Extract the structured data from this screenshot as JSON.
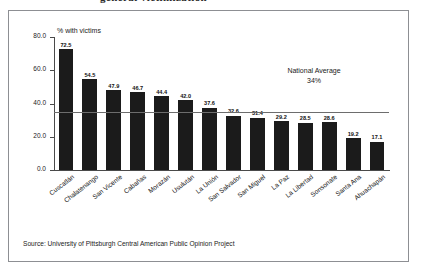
{
  "page": {
    "title_fragment": "general victimization",
    "source_note": "Source:  University of Pittsburgh Central American Public Opinion Project"
  },
  "chart_data": {
    "type": "bar",
    "title": "",
    "xlabel": "",
    "ylabel": "% with victims",
    "ylim": [
      0,
      80
    ],
    "yticks": [
      "0.0",
      "20.0",
      "40.0",
      "60.0",
      "80.0"
    ],
    "grid": false,
    "legend": "none",
    "categories": [
      "Cuscatlán",
      "Chalatenango",
      "San Vicente",
      "Cabañas",
      "Morazán",
      "Usulután",
      "La Unión",
      "San Salvador",
      "San Miguel",
      "La Paz",
      "La Libertad",
      "Sonsonate",
      "Santa Ana",
      "Ahuachapán"
    ],
    "values": [
      72.5,
      54.5,
      47.9,
      46.7,
      44.4,
      42.0,
      37.6,
      32.6,
      31.4,
      29.2,
      28.5,
      28.6,
      19.2,
      17.1
    ],
    "value_labels": [
      "72.5",
      "54.5",
      "47.9",
      "46.7",
      "44.4",
      "42.0",
      "37.6",
      "32.6",
      "31.4",
      "29.2",
      "28.5",
      "28.6",
      "19.2",
      "17.1"
    ],
    "annotations": [
      {
        "name": "national-average",
        "line1": "National Average",
        "line2": "34%",
        "value": 34,
        "marker_category": "La Paz"
      }
    ],
    "bar_color": "#1b1b1b",
    "average_line_color": "#6d6d6d"
  }
}
